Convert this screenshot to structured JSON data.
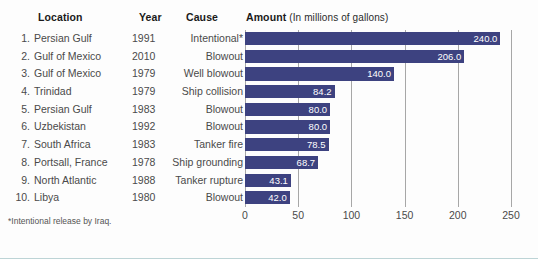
{
  "headers": {
    "location": "Location",
    "year": "Year",
    "cause": "Cause",
    "amount": "Amount",
    "amount_unit": "(In millions of gallons)"
  },
  "footnote": "*Intentional release by Iraq.",
  "colors": {
    "bar": "#3d4280",
    "grid": "#a7a7a7",
    "text": "#4a4a4a",
    "header_text": "#1a1a1a",
    "value_text": "#ffffff",
    "background": "#fdfdfd",
    "bottom_rule": "#bdd4d6"
  },
  "rows": [
    {
      "rank": "1.",
      "location": "Persian Gulf",
      "year": "1991",
      "cause": "Intentional*",
      "value": "240.0"
    },
    {
      "rank": "2.",
      "location": "Gulf of Mexico",
      "year": "2010",
      "cause": "Blowout",
      "value": "206.0"
    },
    {
      "rank": "3.",
      "location": "Gulf of Mexico",
      "year": "1979",
      "cause": "Well blowout",
      "value": "140.0"
    },
    {
      "rank": "4.",
      "location": "Trinidad",
      "year": "1979",
      "cause": "Ship collision",
      "value": "84.2"
    },
    {
      "rank": "5.",
      "location": "Persian Gulf",
      "year": "1983",
      "cause": "Blowout",
      "value": "80.0"
    },
    {
      "rank": "6.",
      "location": "Uzbekistan",
      "year": "1992",
      "cause": "Blowout",
      "value": "80.0"
    },
    {
      "rank": "7.",
      "location": "South Africa",
      "year": "1983",
      "cause": "Tanker fire",
      "value": "78.5"
    },
    {
      "rank": "8.",
      "location": "Portsall, France",
      "year": "1978",
      "cause": "Ship grounding",
      "value": "68.7"
    },
    {
      "rank": "9.",
      "location": "North Atlantic",
      "year": "1988",
      "cause": "Tanker rupture",
      "value": "43.1"
    },
    {
      "rank": "10.",
      "location": "Libya",
      "year": "1980",
      "cause": "Blowout",
      "value": "42.0"
    }
  ],
  "chart_data": {
    "type": "bar",
    "orientation": "horizontal",
    "title": "Amount (In millions of gallons)",
    "xlabel": "",
    "ylabel": "",
    "xlim": [
      0,
      250
    ],
    "xticks": [
      0,
      50,
      100,
      150,
      200,
      250
    ],
    "xtick_labels": [
      "0",
      "50",
      "100",
      "150",
      "200",
      "250"
    ],
    "grid": true,
    "legend": false,
    "categories": [
      "Persian Gulf",
      "Gulf of Mexico",
      "Gulf of Mexico",
      "Trinidad",
      "Persian Gulf",
      "Uzbekistan",
      "South Africa",
      "Portsall, France",
      "North Atlantic",
      "Libya"
    ],
    "values": [
      240.0,
      206.0,
      140.0,
      84.2,
      80.0,
      80.0,
      78.5,
      68.7,
      43.1,
      42.0
    ],
    "data_labels": [
      "240.0",
      "206.0",
      "140.0",
      "84.2",
      "80.0",
      "80.0",
      "78.5",
      "68.7",
      "43.1",
      "42.0"
    ],
    "annotations": [
      "*Intentional release by Iraq."
    ]
  }
}
